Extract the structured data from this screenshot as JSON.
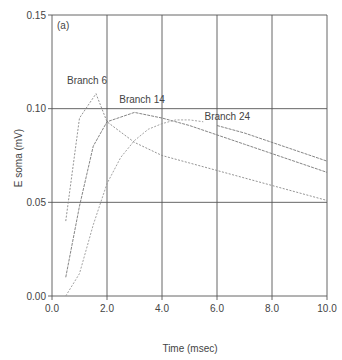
{
  "chart_data": {
    "type": "line",
    "panel_label": "(a)",
    "title": "",
    "xlabel": "Time (msec)",
    "ylabel": "E soma (mV)",
    "xlim": [
      0,
      10
    ],
    "ylim": [
      0,
      0.15
    ],
    "x_ticks": [
      "0.0",
      "2.0",
      "4.0",
      "6.0",
      "8.0",
      "10.0"
    ],
    "y_ticks": [
      "0.00",
      "0.05",
      "0.10",
      "0.15"
    ],
    "grid": true,
    "legend": "inline annotations",
    "series": [
      {
        "name": "Branch 6",
        "label_pos": [
          1.2,
          0.112
        ],
        "x": [
          0.5,
          1.0,
          1.6,
          2.0,
          3.0,
          4.0,
          5.0,
          6.0,
          7.0,
          8.0,
          9.0,
          10.0
        ],
        "y": [
          0.04,
          0.095,
          0.108,
          0.093,
          0.082,
          0.075,
          0.071,
          0.067,
          0.063,
          0.059,
          0.055,
          0.051
        ]
      },
      {
        "name": "Branch 14",
        "label_pos": [
          3.1,
          0.102
        ],
        "x": [
          0.5,
          1.0,
          1.5,
          2.0,
          3.0,
          4.0,
          5.0,
          6.0,
          7.0,
          8.0,
          9.0,
          10.0
        ],
        "y": [
          0.01,
          0.048,
          0.08,
          0.093,
          0.098,
          0.095,
          0.091,
          0.086,
          0.081,
          0.076,
          0.071,
          0.066
        ]
      },
      {
        "name": "Branch 24",
        "label_pos": [
          6.2,
          0.093
        ],
        "x": [
          0.5,
          1.0,
          1.5,
          2.0,
          2.5,
          3.0,
          3.5,
          4.0,
          4.5,
          5.0,
          5.5
        ],
        "y": [
          0.0,
          0.012,
          0.038,
          0.06,
          0.074,
          0.083,
          0.089,
          0.092,
          0.094,
          0.094,
          0.093
        ]
      },
      {
        "name": "Branch 24 (cont.)",
        "x": [
          6.0,
          7.0,
          8.0,
          9.0,
          10.0
        ],
        "y": [
          0.091,
          0.087,
          0.082,
          0.077,
          0.072
        ]
      }
    ]
  }
}
